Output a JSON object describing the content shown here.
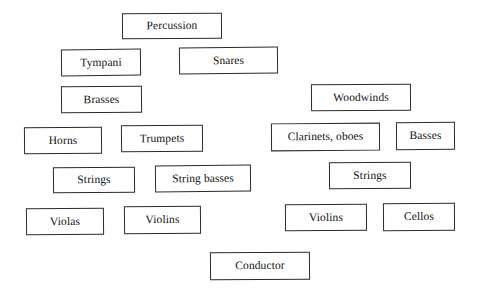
{
  "page": {
    "background_color": "#ffffff",
    "box_border_color": "#2b2b2b",
    "box_fill_color": "#ffffff",
    "text_color": "#111111",
    "width": 481,
    "height": 295
  },
  "nodes": [
    {
      "id": "percussion",
      "label": "Percussion",
      "x": 122,
      "y": 13,
      "w": 100,
      "h": 26,
      "rotate": -0.4
    },
    {
      "id": "tympani",
      "label": "Tympani",
      "x": 61,
      "y": 49,
      "w": 80,
      "h": 27,
      "rotate": -0.6
    },
    {
      "id": "snares",
      "label": "Snares",
      "x": 179,
      "y": 47,
      "w": 99,
      "h": 27,
      "rotate": -0.5
    },
    {
      "id": "brasses",
      "label": "Brasses",
      "x": 61,
      "y": 86,
      "w": 81,
      "h": 27,
      "rotate": -0.5
    },
    {
      "id": "woodwinds",
      "label": "Woodwinds",
      "x": 311,
      "y": 84,
      "w": 100,
      "h": 27,
      "rotate": -0.4
    },
    {
      "id": "horns",
      "label": "Horns",
      "x": 24,
      "y": 127,
      "w": 78,
      "h": 27,
      "rotate": -0.5
    },
    {
      "id": "trumpets",
      "label": "Trumpets",
      "x": 121,
      "y": 125,
      "w": 82,
      "h": 27,
      "rotate": -0.5
    },
    {
      "id": "clarinets-oboes",
      "label": "Clarinets, oboes",
      "x": 271,
      "y": 123,
      "w": 109,
      "h": 28,
      "rotate": -0.4
    },
    {
      "id": "basses",
      "label": "Basses",
      "x": 396,
      "y": 122,
      "w": 59,
      "h": 28,
      "rotate": -0.4
    },
    {
      "id": "strings-left",
      "label": "Strings",
      "x": 53,
      "y": 167,
      "w": 82,
      "h": 26,
      "rotate": -0.5
    },
    {
      "id": "string-basses",
      "label": "String basses",
      "x": 155,
      "y": 165,
      "w": 96,
      "h": 27,
      "rotate": -0.5
    },
    {
      "id": "strings-right",
      "label": "Strings",
      "x": 329,
      "y": 162,
      "w": 82,
      "h": 27,
      "rotate": -0.4
    },
    {
      "id": "violas",
      "label": "Violas",
      "x": 26,
      "y": 208,
      "w": 78,
      "h": 27,
      "rotate": -0.5
    },
    {
      "id": "violins-left",
      "label": "Violins",
      "x": 124,
      "y": 206,
      "w": 77,
      "h": 28,
      "rotate": -0.5
    },
    {
      "id": "violins-right",
      "label": "Violins",
      "x": 285,
      "y": 204,
      "w": 82,
      "h": 27,
      "rotate": -0.4
    },
    {
      "id": "cellos",
      "label": "Cellos",
      "x": 383,
      "y": 203,
      "w": 72,
      "h": 28,
      "rotate": -0.4
    },
    {
      "id": "conductor",
      "label": "Conductor",
      "x": 210,
      "y": 252,
      "w": 100,
      "h": 28,
      "rotate": -0.4
    }
  ]
}
